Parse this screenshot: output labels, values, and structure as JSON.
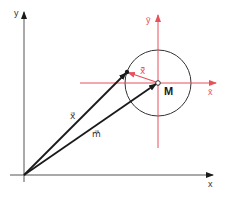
{
  "diagram": {
    "colors": {
      "black": "#1a1a1a",
      "red": "#e8505b",
      "circle": "#333333"
    },
    "axes": {
      "x_label": "x",
      "y_label": "y"
    },
    "local_axes": {
      "x_label": "x̄",
      "y_label": "ȳ"
    },
    "vectors": {
      "x_label": "x⃗",
      "m_label": "m⃗",
      "local_x_label": "x̄⃗"
    },
    "point_label": "M"
  }
}
